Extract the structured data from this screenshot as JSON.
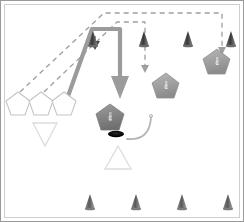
{
  "scene": {
    "title": "Tactical Formation Overview",
    "background_color": "#ffffff",
    "frame_border_color": "#9a9a9a",
    "frame_inner_color": "#c8c8c8"
  },
  "palette": {
    "cone_dark": "#4a4a4a",
    "cone_mid": "#7a7a7a",
    "pentagon_fill_dark": "#8c8c8c",
    "pentagon_fill_mid": "#a8a8a8",
    "pentagon_outline": "#bdbdbd",
    "triangle_outline": "#d8d8d8",
    "dashed_path": "#9e9e9e",
    "thick_arrow": "#9b9b9b",
    "arc_curve": "#b5b5b5",
    "ellipse_marker": "#000000"
  },
  "legend": {
    "cone_name": "cone-marker",
    "pentagon_name": "pentagon-unit",
    "triangle_name": "triangle-outline",
    "dashed_name": "dashed-move-path",
    "thick_name": "thick-move-arrow",
    "arc_name": "arc-path",
    "ellipse_name": "ellipse-marker"
  },
  "units": {
    "staged_pentagons": [
      {
        "id": "staged-1",
        "label": "",
        "cx": 18,
        "cy": 104,
        "r": 13,
        "style": "outline"
      },
      {
        "id": "staged-2",
        "label": "",
        "cx": 41,
        "cy": 104,
        "r": 13,
        "style": "outline"
      },
      {
        "id": "staged-3",
        "label": "",
        "cx": 64,
        "cy": 104,
        "r": 13,
        "style": "outline"
      }
    ],
    "active_pentagons": [
      {
        "id": "active-center",
        "label": "C",
        "cx": 110,
        "cy": 118,
        "r": 15,
        "style": "filled-dark"
      },
      {
        "id": "active-mid",
        "label": "C",
        "cx": 166,
        "cy": 86,
        "r": 14,
        "style": "filled-mid"
      },
      {
        "id": "active-right",
        "label": "C",
        "cx": 217,
        "cy": 62,
        "r": 14,
        "style": "filled-mid"
      }
    ]
  },
  "markers": {
    "cones_top": [
      {
        "id": "cone-top-1",
        "x": 93,
        "y": 32
      },
      {
        "id": "cone-top-2",
        "x": 144,
        "y": 32
      },
      {
        "id": "cone-top-3",
        "x": 188,
        "y": 32
      },
      {
        "id": "cone-top-4",
        "x": 231,
        "y": 32
      }
    ],
    "cones_bottom": [
      {
        "id": "cone-bot-1",
        "x": 90,
        "y": 196
      },
      {
        "id": "cone-bot-2",
        "x": 136,
        "y": 196
      },
      {
        "id": "cone-bot-3",
        "x": 182,
        "y": 196
      },
      {
        "id": "cone-bot-4",
        "x": 228,
        "y": 196
      }
    ],
    "triangles": [
      {
        "id": "triangle-down-left",
        "cx": 45,
        "cy": 134,
        "size": 22,
        "dir": "down"
      },
      {
        "id": "triangle-up-center",
        "cx": 118,
        "cy": 158,
        "size": 22,
        "dir": "up"
      }
    ],
    "ellipse": {
      "id": "ellipse-marker",
      "cx": 116,
      "cy": 134,
      "rx": 8,
      "ry": 3.2
    }
  },
  "paths": {
    "dashed_outer": {
      "id": "dashed-path-outer",
      "points": "20,92 105,13 222,13 222,48",
      "arrow_at": {
        "x": 222,
        "y": 52
      }
    },
    "dashed_inner": {
      "id": "dashed-path-inner",
      "points": "44,92 118,22 145,22 145,66",
      "arrow_at": {
        "x": 145,
        "y": 70
      }
    },
    "thick_arrow": {
      "id": "thick-move-arrow",
      "points": "66,98 92,28 121,28 121,80",
      "arrow_at": {
        "x": 121,
        "y": 98
      }
    },
    "small_arrow_down": {
      "id": "small-arrow-down-center",
      "x": 95,
      "y_from": 36,
      "y_to": 48
    },
    "arc": {
      "id": "arc-path",
      "d": "M 127,138 Q 149,140 151,118"
    }
  }
}
